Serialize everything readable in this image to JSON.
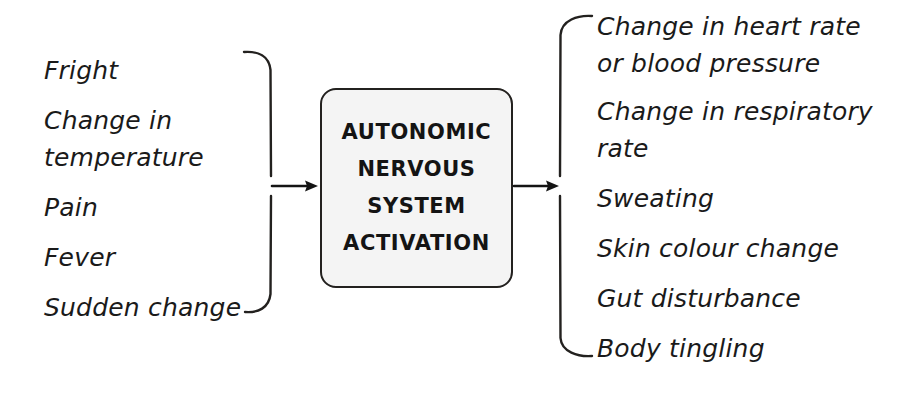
{
  "diagram": {
    "title": "Autonomic Nervous System Activation",
    "ink_color": "#23211f",
    "box_fill_color": "#f4f4f4",
    "background_color": "#ffffff"
  },
  "triggers": {
    "group_label": "Triggers",
    "bracket": "right-closing-bracket",
    "items": [
      {
        "line1": "Fright"
      },
      {
        "line1": "Change in",
        "line2": "temperature"
      },
      {
        "line1": "Pain"
      },
      {
        "line1": "Fever"
      },
      {
        "line1": "Sudden change"
      }
    ]
  },
  "process": {
    "lines": [
      "AUTONOMIC",
      "NERVOUS",
      "SYSTEM",
      "ACTIVATION"
    ]
  },
  "responses": {
    "group_label": "Responses",
    "bracket": "left-opening-bracket",
    "items": [
      {
        "line1": "Change in heart rate",
        "line2": "or blood pressure"
      },
      {
        "line1": "Change in respiratory",
        "line2": "rate"
      },
      {
        "line1": "Sweating"
      },
      {
        "line1": "Skin colour change"
      },
      {
        "line1": "Gut disturbance"
      },
      {
        "line1": "Body tingling"
      }
    ]
  },
  "connectors": {
    "input_arrow_label": "arrow from triggers to activation",
    "output_arrow_label": "arrow from activation to responses"
  }
}
